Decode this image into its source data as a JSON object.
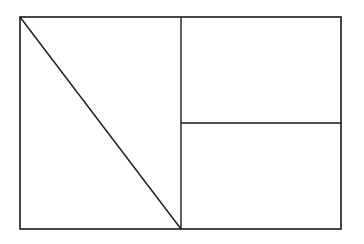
{
  "diagram": {
    "type": "geometric-partition",
    "stroke_color": "#1a1a1a",
    "background_color": "#ffffff",
    "outer_rectangle": {
      "x1": 20,
      "y1": 17,
      "x2": 341,
      "y2": 229
    },
    "vertical_divider": {
      "x": 181,
      "y1": 17,
      "y2": 229
    },
    "horizontal_divider": {
      "y": 123,
      "x1": 181,
      "x2": 341
    },
    "diagonal": {
      "x1": 20,
      "y1": 17,
      "x2": 181,
      "y2": 229
    },
    "regions": [
      "left-upper-triangle",
      "left-lower-triangle",
      "right-top-rectangle",
      "right-bottom-rectangle"
    ]
  }
}
